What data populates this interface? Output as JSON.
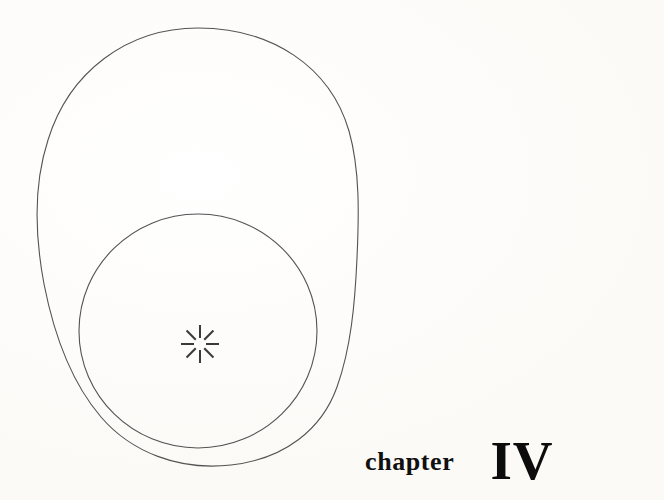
{
  "page": {
    "width": 664,
    "height": 500,
    "background_color": "#fdfcfa",
    "ink_color": "#4a4a4a",
    "text_color": "#111010"
  },
  "chapter_label": {
    "word": "chapter",
    "numeral": "IV"
  },
  "figure": {
    "stroke_color": "#555253",
    "stroke_width": 1.1,
    "fill": "none",
    "shapes": [
      {
        "name": "large-egg-outline",
        "type": "closed-curve",
        "bounds": {
          "left": 37,
          "top": 28,
          "right": 359,
          "bottom": 466
        },
        "center": {
          "x": 198,
          "y": 245
        }
      },
      {
        "name": "circle-outline",
        "type": "circle",
        "center": {
          "x": 198,
          "y": 331
        },
        "radius_x": 119,
        "radius_y": 117,
        "bounds": {
          "left": 79,
          "top": 214,
          "right": 317,
          "bottom": 448
        }
      }
    ],
    "starburst": {
      "name": "eight-ray-starburst",
      "center": {
        "x": 200,
        "y": 344
      },
      "ray_count": 8,
      "inner_radius": 6,
      "outer_radius": 19,
      "stroke_color": "#3a3839",
      "stroke_width": 2
    }
  }
}
